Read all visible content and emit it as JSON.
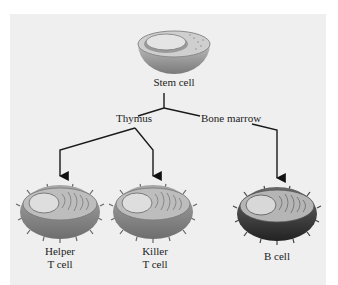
{
  "diagram": {
    "colors": {
      "background": "#ffffff",
      "panel": "#efefef",
      "line": "#1a1a1a",
      "t_cell_body": "#8a8a8a",
      "b_cell_body": "#3a3a3a",
      "nucleus": "#d9d9d9"
    },
    "nodes": {
      "stem_cell": {
        "label": "Stem cell"
      },
      "thymus": {
        "label": "Thymus"
      },
      "bone_marrow": {
        "label": "Bone marrow"
      },
      "helper_t_cell": {
        "label_line1": "Helper",
        "label_line2": "T cell"
      },
      "killer_t_cell": {
        "label_line1": "Killer",
        "label_line2": "T cell"
      },
      "b_cell": {
        "label": "B cell"
      }
    },
    "edges": [
      {
        "from": "Stem cell",
        "to": "Thymus"
      },
      {
        "from": "Stem cell",
        "to": "Bone marrow"
      },
      {
        "from": "Thymus",
        "to": "Helper T cell"
      },
      {
        "from": "Thymus",
        "to": "Killer T cell"
      },
      {
        "from": "Bone marrow",
        "to": "B cell"
      }
    ]
  }
}
